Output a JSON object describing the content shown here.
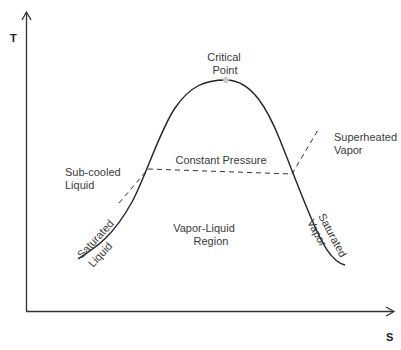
{
  "diagram": {
    "type": "T-S diagram (temperature-entropy)",
    "axes": {
      "y_label": "T",
      "x_label": "S"
    },
    "labels": {
      "critical_point_line1": "Critical",
      "critical_point_line2": "Point",
      "constant_pressure": "Constant Pressure",
      "subcooled_line1": "Sub-cooled",
      "subcooled_line2": "Liquid",
      "superheated_line1": "Superheated",
      "superheated_line2": "Vapor",
      "region_line1": "Vapor-Liquid",
      "region_line2": "Region",
      "sat_liquid_outer": "Saturated",
      "sat_liquid_inner": "Liquid",
      "sat_vapor_outer": "Saturated",
      "sat_vapor_inner": "Vapor"
    },
    "colors": {
      "curve": "#222222",
      "axis": "#333333",
      "critical_point": "#c8c8c8",
      "text": "#3a3a3a"
    }
  }
}
